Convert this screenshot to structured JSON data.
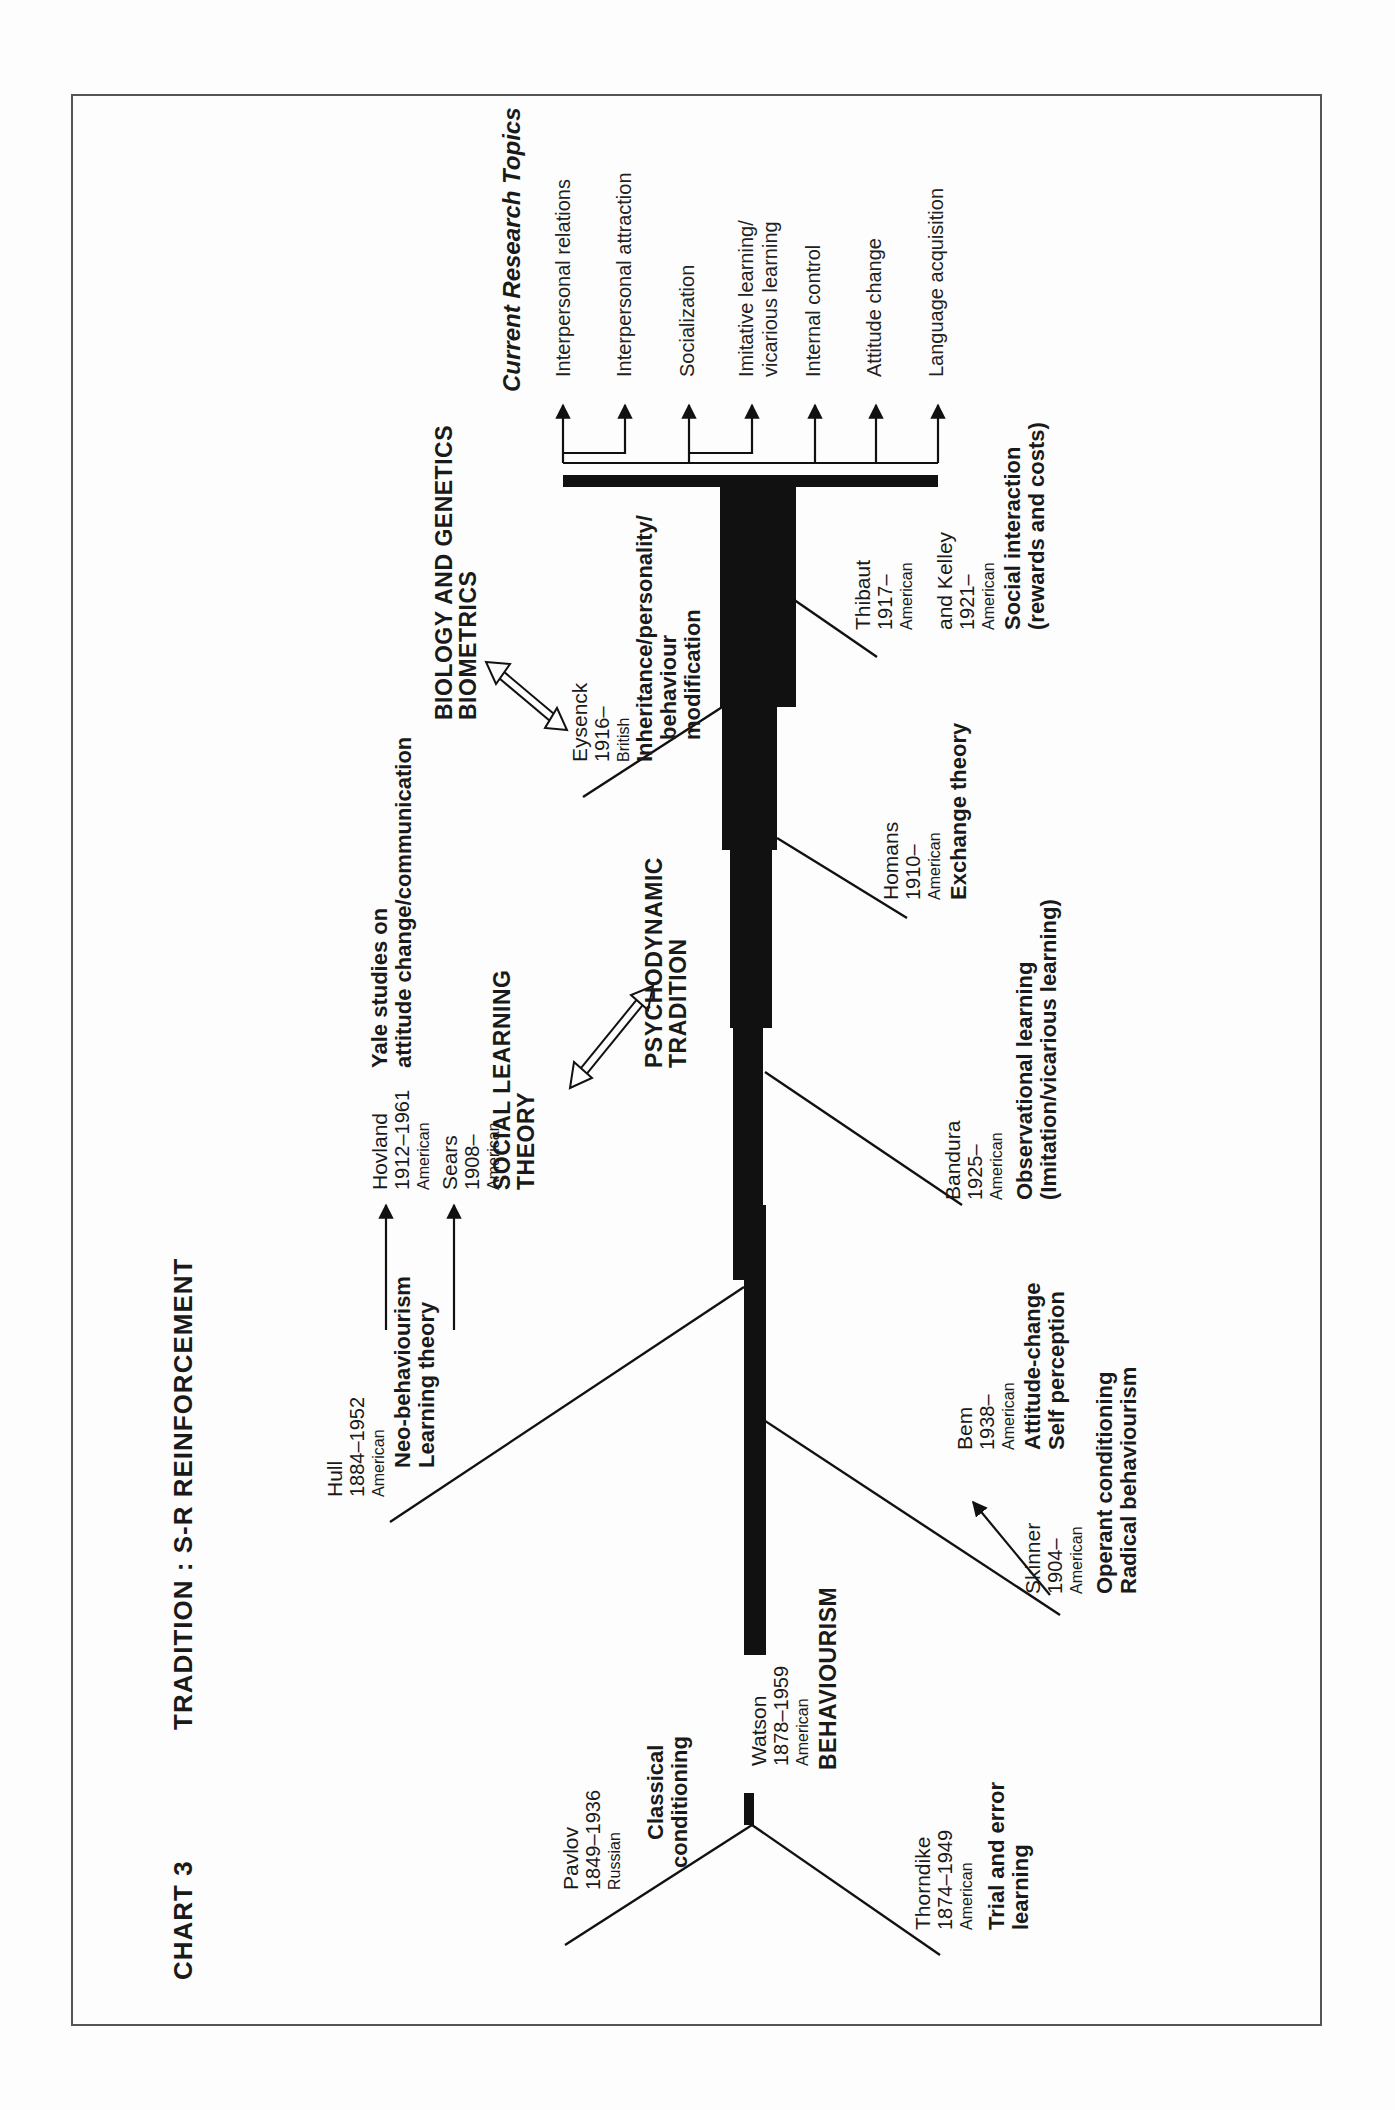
{
  "chart": {
    "number": "CHART 3",
    "title": "TRADITION : S-R REINFORCEMENT"
  },
  "theorists": {
    "pavlov": {
      "name": "Pavlov",
      "years": "1849–1936",
      "nationality": "Russian",
      "contribution": [
        "Classical",
        "conditioning"
      ]
    },
    "thorndike": {
      "name": "Thorndike",
      "years": "1874–1949",
      "nationality": "American",
      "contribution": [
        "Trial and error",
        "learning"
      ]
    },
    "watson": {
      "name": "Watson",
      "years": "1878–1959",
      "nationality": "American",
      "school": "BEHAVIOURISM"
    },
    "hull": {
      "name": "Hull",
      "years": "1884–1952",
      "nationality": "American",
      "contribution": [
        "Neo-behaviourism",
        "Learning theory"
      ]
    },
    "hovland": {
      "name": "Hovland",
      "years": "1912–1961",
      "nationality": "American",
      "contribution": [
        "Yale studies on",
        "attitude change/communication"
      ]
    },
    "sears": {
      "name": "Sears",
      "years": "1908–",
      "nationality": "American",
      "contribution": [
        "SOCIAL LEARNING",
        "THEORY"
      ]
    },
    "skinner": {
      "name": "Skinner",
      "years": "1904–",
      "nationality": "American",
      "contribution": [
        "Operant conditioning",
        "Radical behaviourism"
      ]
    },
    "bem": {
      "name": "Bem",
      "years": "1938–",
      "nationality": "American",
      "contribution": [
        "Attitude-change",
        "Self perception"
      ]
    },
    "bandura": {
      "name": "Bandura",
      "years": "1925–",
      "nationality": "American",
      "contribution": [
        "Observational learning",
        "(Imitation/vicarious learning)"
      ]
    },
    "homans": {
      "name": "Homans",
      "years": "1910–",
      "nationality": "American",
      "contribution": [
        "Exchange theory"
      ]
    },
    "eysenck": {
      "name": "Eysenck",
      "years": "1916–",
      "nationality": "British",
      "contribution": [
        "Inheritance/personality/",
        "behaviour",
        "modification"
      ]
    },
    "thibaut": {
      "name": "Thibaut",
      "years": "1917–",
      "nationality": "American"
    },
    "kelley": {
      "name": "and Kelley",
      "years": "1921–",
      "nationality": "American",
      "contribution": [
        "Social interaction",
        "(rewards and costs)"
      ]
    }
  },
  "related_traditions": {
    "psychodynamic": [
      "PSYCHODYNAMIC",
      "TRADITION"
    ],
    "biology": [
      "BIOLOGY AND GENETICS",
      "BIOMETRICS"
    ]
  },
  "current_research": {
    "heading": "Current Research Topics",
    "topics": [
      [
        "Interpersonal relations"
      ],
      [
        "Interpersonal attraction"
      ],
      [
        "Socialization"
      ],
      [
        "Imitative learning/",
        "vicarious learning"
      ],
      [
        "Internal control"
      ],
      [
        "Attitude change"
      ],
      [
        "Language acquisition"
      ]
    ]
  },
  "colors": {
    "ink": "#111111",
    "paper": "#fdfdfd",
    "frame": "#555555"
  }
}
